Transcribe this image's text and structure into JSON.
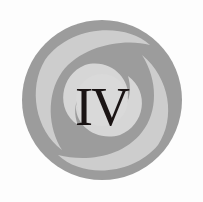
{
  "emblem": {
    "numeral": "IV",
    "colors": {
      "dark_ring": "#9a9a9a",
      "light_swirl": "#cfcfcf",
      "center": "#d8d8d8",
      "text": "#1a1414",
      "background": "#fdfdfd"
    }
  }
}
